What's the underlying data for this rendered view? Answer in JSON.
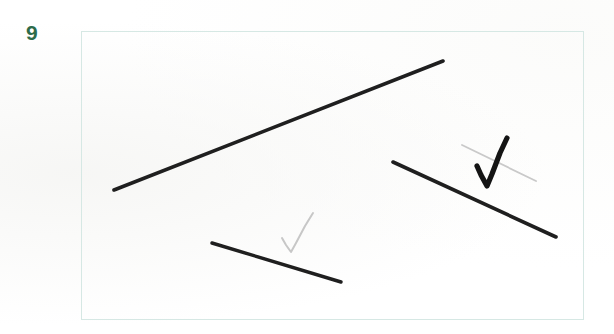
{
  "page": {
    "background_color": "#ffffff",
    "width": 614,
    "height": 334
  },
  "item": {
    "number_label": "9",
    "number_color": "#2d6b4a"
  },
  "answer_box": {
    "border_color": "#d6e8e4",
    "fill_color": "#ffffff",
    "x": 81,
    "y": 31,
    "width": 503,
    "height": 289
  },
  "figure": {
    "ink_color": "#1a1a1a",
    "faint_ink_color": "#c9c9c9",
    "strokes": [
      {
        "name": "long-diagonal-line",
        "kind": "line-segment",
        "color": "#1f1f1f",
        "width": 3.6,
        "x1": 114,
        "y1": 190,
        "x2": 443,
        "y2": 61
      },
      {
        "name": "right-descending-line",
        "kind": "line-segment",
        "color": "#1f1f1f",
        "width": 3.6,
        "x1": 393,
        "y1": 162,
        "x2": 556,
        "y2": 237
      },
      {
        "name": "bottom-short-line",
        "kind": "line-segment",
        "color": "#1f1f1f",
        "width": 3.4,
        "x1": 212,
        "y1": 243,
        "x2": 341,
        "y2": 282
      }
    ],
    "marks": [
      {
        "name": "faint-slash-mark",
        "kind": "line-segment",
        "color": "#c9c9c9",
        "width": 1.8,
        "x1": 462,
        "y1": 145,
        "x2": 536,
        "y2": 181
      },
      {
        "name": "grader-check-mark",
        "kind": "check",
        "color": "#141414",
        "points": "477,166 481,175 487,186 492,174 500,153 507,138",
        "width": 5.2
      },
      {
        "name": "faint-check-mark",
        "kind": "check",
        "color": "#c7c7c7",
        "points": "282,238 286,245 291,252 296,243 305,226 313,213",
        "width": 2.0
      }
    ]
  },
  "accessibility": {
    "figure_alt": "Question 9 answer box containing three hand drawn line segments with a teacher check mark"
  }
}
